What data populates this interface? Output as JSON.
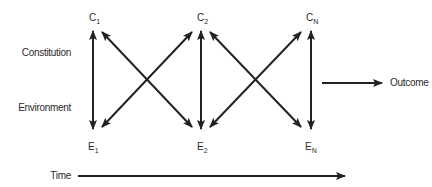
{
  "diagram": {
    "row_labels": {
      "constitution": "Constitution",
      "environment": "Environment"
    },
    "nodes": {
      "c1": {
        "base": "C",
        "sub": "1"
      },
      "c2": {
        "base": "C",
        "sub": "2"
      },
      "cn": {
        "base": "C",
        "sub": "N"
      },
      "e1": {
        "base": "E",
        "sub": "1"
      },
      "e2": {
        "base": "E",
        "sub": "2"
      },
      "en": {
        "base": "E",
        "sub": "N"
      }
    },
    "outcome_label": "Outcome",
    "time_label": "Time",
    "edges": [
      {
        "from": "C1",
        "to": "E1",
        "type": "bidirectional"
      },
      {
        "from": "C1",
        "to": "E2",
        "type": "bidirectional"
      },
      {
        "from": "E1",
        "to": "C2",
        "type": "bidirectional"
      },
      {
        "from": "C2",
        "to": "E2",
        "type": "bidirectional"
      },
      {
        "from": "C2",
        "to": "EN",
        "type": "bidirectional"
      },
      {
        "from": "E2",
        "to": "CN",
        "type": "bidirectional"
      },
      {
        "from": "CN",
        "to": "EN",
        "type": "bidirectional"
      },
      {
        "from": "CN/EN",
        "to": "Outcome",
        "type": "directed"
      }
    ],
    "colors": {
      "stroke": "#222222",
      "text": "#2b2b2b"
    }
  }
}
